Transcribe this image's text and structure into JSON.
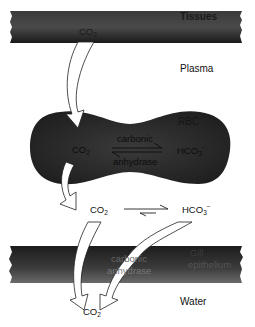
{
  "regions": {
    "tissues": "Tissues",
    "plasma": "Plasma",
    "rbc": "RBC",
    "gill_line1": "Gill",
    "gill_line2": "epithelium",
    "water": "Water"
  },
  "species": {
    "co2_base": "CO",
    "co2_sub": "2",
    "hco3_base": "HCO",
    "hco3_sub": "3",
    "hco3_sup": "−"
  },
  "enzyme": {
    "rbc_top": "carbonic",
    "rbc_bottom": "anhydrase",
    "gill_top": "carbonic",
    "gill_bottom": "anhydrase"
  },
  "colors": {
    "band_dark": "#1e1e1e",
    "band_mid": "#555555",
    "rbc_fill": "#2b2b2b",
    "background": "#ffffff",
    "arrow_fill": "#ffffff",
    "arrow_stroke": "#222222"
  }
}
